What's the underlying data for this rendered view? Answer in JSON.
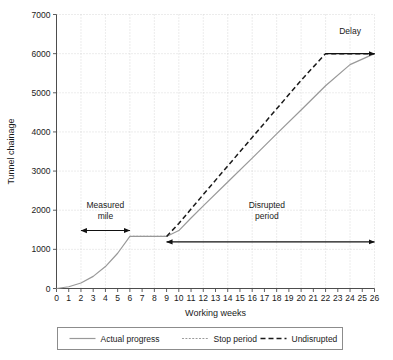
{
  "chart_data": {
    "type": "line",
    "title": "",
    "xlabel": "Working weeks",
    "ylabel": "Tunnel chainage",
    "xlim": [
      0,
      26
    ],
    "ylim": [
      0,
      7000
    ],
    "xticks": [
      0,
      1,
      2,
      3,
      4,
      5,
      6,
      7,
      8,
      9,
      10,
      11,
      12,
      13,
      14,
      15,
      16,
      17,
      18,
      19,
      20,
      21,
      22,
      23,
      24,
      25,
      26
    ],
    "xtick_labels": [
      "0",
      "1",
      "2",
      "3",
      "4",
      "5",
      "6",
      "7",
      "8",
      "9",
      "10",
      "11",
      "12",
      "13",
      "14",
      "15",
      "16",
      "17",
      "18",
      "19",
      "20",
      "21",
      "22",
      "23",
      "24",
      "25",
      "26"
    ],
    "yticks": [
      0,
      1000,
      2000,
      3000,
      4000,
      5000,
      6000,
      7000
    ],
    "ytick_labels": [
      "0",
      "1000",
      "2000",
      "3000",
      "4000",
      "5000",
      "6000",
      "7000"
    ],
    "grid": true,
    "grid_style": "dotted",
    "grid_x_interval": 2,
    "grid_y_interval": 1000,
    "legend_position": "below",
    "series": [
      {
        "name": "Actual progress",
        "style": "solid",
        "color": "#999999",
        "points": [
          [
            0,
            0
          ],
          [
            1,
            45
          ],
          [
            2,
            140
          ],
          [
            3,
            310
          ],
          [
            4,
            560
          ],
          [
            5,
            900
          ],
          [
            6,
            1330
          ],
          [
            9,
            1330
          ],
          [
            10,
            1480
          ],
          [
            11,
            1800
          ],
          [
            12,
            2110
          ],
          [
            14,
            2720
          ],
          [
            16,
            3330
          ],
          [
            18,
            3950
          ],
          [
            20,
            4560
          ],
          [
            22,
            5180
          ],
          [
            24,
            5720
          ],
          [
            26,
            6000
          ]
        ]
      },
      {
        "name": "Stop period",
        "style": "dotted",
        "color": "#999999",
        "points": [
          [
            6,
            1330
          ],
          [
            9,
            1330
          ]
        ]
      },
      {
        "name": "Undisrupted",
        "style": "dashed",
        "color": "#1a1a1a",
        "points": [
          [
            9,
            1330
          ],
          [
            10,
            1660
          ],
          [
            12,
            2400
          ],
          [
            14,
            3130
          ],
          [
            16,
            3860
          ],
          [
            18,
            4590
          ],
          [
            20,
            5320
          ],
          [
            22,
            6000
          ],
          [
            26,
            6000
          ]
        ]
      }
    ],
    "annotations": [
      {
        "name": "measured-mile",
        "label_line1": "Measured",
        "label_line2": "mile",
        "label_x": 4.0,
        "label_y": 2050,
        "arrow_x_start": 2,
        "arrow_x_end": 6,
        "arrow_y": 1480,
        "arrow_style": "double-headed"
      },
      {
        "name": "disrupted-period",
        "label_line1": "Disrupted",
        "label_line2": "period",
        "label_x": 17.2,
        "label_y": 2050,
        "arrow_x_start": 9,
        "arrow_x_end": 26,
        "arrow_y": 1190,
        "arrow_style": "double-headed"
      },
      {
        "name": "delay",
        "label_line1": "Delay",
        "label_line2": "",
        "label_x": 24.0,
        "label_y": 6500,
        "arrow_x_start": 22,
        "arrow_x_end": 26,
        "arrow_y": 6000,
        "arrow_style": "single-headed"
      }
    ]
  },
  "legend": {
    "entries": [
      {
        "label": "Actual progress",
        "style": "solid",
        "color": "#999999"
      },
      {
        "label": "Stop period",
        "style": "dotted",
        "color": "#999999"
      },
      {
        "label": "Undisrupted",
        "style": "dashed",
        "color": "#1a1a1a"
      }
    ]
  },
  "colors": {
    "actual": "#999999",
    "undisrupted": "#1a1a1a",
    "axis": "#4d4d4d",
    "grid": "#c8c8c8",
    "legend_border": "#8c8c8c"
  }
}
